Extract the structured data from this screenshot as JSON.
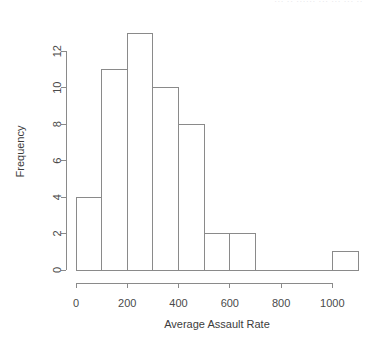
{
  "watermark": {
    "text": "··· ·· ······ ··· ··· ··· ··"
  },
  "chart_data": {
    "type": "bar",
    "title": "",
    "subtitle": "",
    "xlabel": "Average Assault Rate",
    "ylabel": "Frequency",
    "grid": false,
    "legend": false,
    "legend_position": "none",
    "bin_width": 100,
    "bin_edges": [
      0,
      100,
      200,
      300,
      400,
      500,
      600,
      700,
      800,
      900,
      1000,
      1100
    ],
    "categories": [
      "0-100",
      "100-200",
      "200-300",
      "300-400",
      "400-500",
      "500-600",
      "600-700",
      "700-800",
      "800-900",
      "900-1000",
      "1000-1100"
    ],
    "values": [
      4,
      11,
      13,
      10,
      8,
      2,
      2,
      0,
      0,
      0,
      1
    ],
    "xlim": [
      0,
      1100
    ],
    "ylim": [
      0,
      13
    ],
    "xticks": [
      0,
      200,
      400,
      600,
      800,
      1000
    ],
    "xticklabels": [
      "0",
      "200",
      "400",
      "600",
      "800",
      "1000"
    ],
    "yticks": [
      0,
      2,
      4,
      6,
      8,
      10,
      12
    ],
    "yticklabels": [
      "0",
      "2",
      "4",
      "6",
      "8",
      "10",
      "12"
    ],
    "bar_fill_color": "#ffffff",
    "bar_edge_color": "#8a8a8a",
    "axis_color": "#8a8a8a",
    "text_color": "#3c3c3c",
    "background_color": "#ffffff"
  }
}
